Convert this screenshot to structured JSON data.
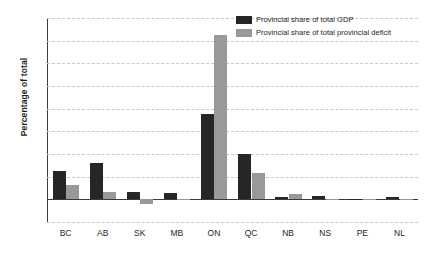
{
  "chart_data": {
    "type": "bar",
    "title": "",
    "xlabel": "",
    "ylabel": "Percentage of total",
    "ylim": [
      -10,
      80
    ],
    "ytick_step": 10,
    "yticks": [
      "80",
      "70",
      "60",
      "50",
      "40",
      "30",
      "20",
      "10",
      "0",
      "-10"
    ],
    "grid": true,
    "legend_position": "top-right",
    "categories": [
      "BC",
      "AB",
      "SK",
      "MB",
      "ON",
      "QC",
      "NB",
      "NS",
      "PE",
      "NL"
    ],
    "series": [
      {
        "name": "Provincial share of total GDP",
        "color": "#262626",
        "values": [
          12.3,
          16.2,
          3.2,
          2.7,
          37.8,
          19.8,
          1.2,
          1.5,
          0.2,
          1.0
        ]
      },
      {
        "name": "Provincial share of total provincial deficit",
        "color": "#999999",
        "values": [
          6.3,
          3.3,
          -2.0,
          0.2,
          72.5,
          11.8,
          2.2,
          0.3,
          0.05,
          0.3
        ]
      }
    ]
  }
}
